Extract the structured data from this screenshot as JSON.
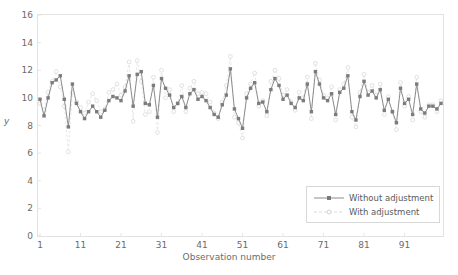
{
  "chart_data": {
    "type": "line",
    "title": "",
    "xlabel": "Observation number",
    "ylabel": "y",
    "xlim": [
      1,
      100
    ],
    "ylim": [
      0,
      16
    ],
    "ytick_values": [
      0,
      2,
      4,
      6,
      8,
      10,
      12,
      14,
      16
    ],
    "xtick_values": [
      1,
      11,
      21,
      31,
      41,
      51,
      61,
      71,
      81,
      91
    ],
    "grid": false,
    "legend_position": "lower right",
    "x": [
      1,
      2,
      3,
      4,
      5,
      6,
      7,
      8,
      9,
      10,
      11,
      12,
      13,
      14,
      15,
      16,
      17,
      18,
      19,
      20,
      21,
      22,
      23,
      24,
      25,
      26,
      27,
      28,
      29,
      30,
      31,
      32,
      33,
      34,
      35,
      36,
      37,
      38,
      39,
      40,
      41,
      42,
      43,
      44,
      45,
      46,
      47,
      48,
      49,
      50,
      51,
      52,
      53,
      54,
      55,
      56,
      57,
      58,
      59,
      60,
      61,
      62,
      63,
      64,
      65,
      66,
      67,
      68,
      69,
      70,
      71,
      72,
      73,
      74,
      75,
      76,
      77,
      78,
      79,
      80,
      81,
      82,
      83,
      84,
      85,
      86,
      87,
      88,
      89,
      90,
      91,
      92,
      93,
      94,
      95,
      96,
      97,
      98,
      99,
      100
    ],
    "series": [
      {
        "name": "Without adjustment",
        "color": "#8c8c8c",
        "marker": "filled-square",
        "linestyle": "solid",
        "values": [
          9.9,
          8.7,
          10.0,
          11.1,
          11.3,
          11.6,
          9.9,
          7.9,
          11.0,
          9.6,
          9.0,
          8.5,
          9.0,
          9.4,
          9.0,
          8.6,
          9.1,
          9.8,
          10.1,
          10.0,
          9.8,
          10.5,
          11.6,
          9.4,
          11.7,
          11.9,
          9.6,
          9.5,
          10.9,
          8.6,
          11.4,
          10.7,
          10.2,
          9.3,
          9.6,
          10.1,
          9.3,
          10.3,
          10.6,
          9.9,
          10.1,
          9.8,
          9.3,
          8.8,
          8.6,
          9.5,
          10.2,
          12.1,
          9.2,
          8.5,
          7.8,
          10.0,
          10.7,
          11.1,
          9.6,
          9.7,
          9.0,
          10.6,
          11.4,
          10.9,
          9.9,
          10.2,
          9.6,
          9.3,
          10.0,
          9.8,
          11.0,
          9.0,
          11.9,
          11.0,
          10.0,
          9.8,
          10.3,
          8.8,
          10.4,
          10.7,
          11.6,
          9.0,
          8.4,
          10.1,
          11.2,
          10.2,
          10.5,
          10.0,
          10.6,
          9.1,
          9.9,
          9.0,
          8.2,
          10.7,
          9.6,
          9.9,
          8.8,
          11.0,
          9.2,
          8.9,
          9.4,
          9.4,
          9.2,
          9.6
        ]
      },
      {
        "name": "With adjustment",
        "color": "#e3e3e3",
        "marker": "open-circle",
        "linestyle": "dashed",
        "values": [
          9.6,
          9.1,
          10.4,
          11.2,
          11.9,
          10.8,
          9.4,
          6.1,
          10.4,
          9.7,
          9.3,
          8.9,
          9.7,
          10.3,
          9.8,
          9.0,
          9.2,
          10.4,
          10.6,
          11.0,
          10.2,
          10.8,
          12.6,
          8.3,
          12.7,
          11.2,
          8.8,
          9.0,
          11.5,
          7.5,
          12.0,
          10.0,
          10.6,
          9.0,
          9.6,
          10.9,
          9.0,
          10.7,
          11.2,
          10.3,
          10.4,
          10.3,
          9.7,
          8.9,
          8.5,
          9.7,
          10.9,
          13.0,
          8.6,
          8.2,
          7.1,
          10.3,
          11.0,
          11.8,
          9.4,
          9.8,
          8.7,
          11.2,
          12.0,
          11.4,
          10.2,
          10.6,
          9.7,
          9.1,
          10.4,
          10.0,
          11.5,
          8.5,
          12.5,
          11.3,
          10.2,
          10.0,
          10.8,
          8.4,
          10.6,
          11.0,
          12.2,
          8.6,
          7.9,
          10.4,
          11.7,
          10.4,
          10.9,
          10.2,
          11.0,
          8.8,
          10.1,
          9.0,
          7.7,
          11.1,
          9.4,
          10.1,
          8.4,
          11.5,
          9.0,
          8.6,
          9.5,
          9.5,
          9.0,
          9.8
        ]
      }
    ]
  },
  "legend": {
    "items": [
      {
        "label": "Without adjustment"
      },
      {
        "label": "With adjustment"
      }
    ]
  },
  "colors": {
    "series_without_adjustment": "#8c8c8c",
    "series_with_adjustment": "#e3e3e3",
    "axis": "#d9d9d9",
    "text": "#6b6b6b",
    "background": "#ffffff"
  }
}
